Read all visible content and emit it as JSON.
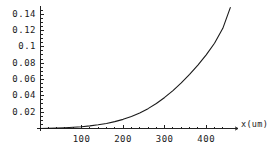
{
  "chart_data": {
    "type": "line",
    "title": "",
    "subtitle": "",
    "xlabel": "x(um)",
    "ylabel": "",
    "xlim": [
      0,
      460
    ],
    "ylim": [
      0,
      0.152
    ],
    "grid": false,
    "legend": null,
    "xticks": [
      100,
      200,
      300,
      400
    ],
    "xtick_labels": [
      "100",
      "200",
      "300",
      "400"
    ],
    "yticks": [
      0.02,
      0.04,
      0.06,
      0.08,
      0.1,
      0.12,
      0.14
    ],
    "ytick_labels": [
      "0.02",
      "0.04",
      "0.06",
      "0.08",
      "0.1",
      "0.12",
      "0.14"
    ],
    "minor_ticks": true,
    "series": [
      {
        "name": "curve",
        "color": "#1a1a1a",
        "x": [
          0,
          20,
          40,
          60,
          80,
          100,
          120,
          140,
          160,
          180,
          200,
          220,
          240,
          260,
          280,
          300,
          320,
          340,
          360,
          380,
          400,
          420,
          440,
          458
        ],
        "y": [
          0.0,
          0.0002,
          0.0005,
          0.0009,
          0.0015,
          0.0022,
          0.0032,
          0.0045,
          0.0062,
          0.0084,
          0.0112,
          0.0147,
          0.019,
          0.0243,
          0.0306,
          0.038,
          0.0464,
          0.0558,
          0.0662,
          0.0776,
          0.0902,
          0.1044,
          0.1226,
          0.148
        ]
      }
    ]
  },
  "axes": {
    "x_axis_label": "x(um)"
  }
}
